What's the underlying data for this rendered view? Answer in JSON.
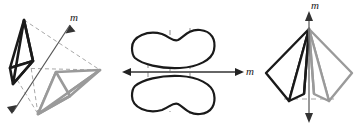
{
  "figure": {
    "caption_absent": true,
    "topic": "mirror-plane symmetry operations",
    "panels": [
      {
        "id": "panel-left",
        "name": "oblique-tetrahedra-pair",
        "axis_label": "m",
        "axis_orientation": "diagonal",
        "arrow_heads": "double",
        "object_count": 2,
        "object_dark_color": "#1a1a1a",
        "object_light_color": "#9a9a9a",
        "dashed_color": "#a8a8a8"
      },
      {
        "id": "panel-middle",
        "name": "reflected-blob-pair",
        "axis_label": "m",
        "axis_orientation": "horizontal",
        "arrow_heads": "double",
        "object_count": 2,
        "outline_color": "#1a1a1a",
        "dashed_color": "#a0a0a0"
      },
      {
        "id": "panel-right",
        "name": "mirrored-pyramid-pair",
        "axis_label": "m",
        "axis_orientation": "vertical",
        "arrow_heads": "double",
        "object_count": 2,
        "object_dark_color": "#1a1a1a",
        "object_light_color": "#9a9a9a",
        "dashed_color": "#a8a8a8"
      }
    ],
    "labels": {
      "left_m": "m",
      "middle_m": "m",
      "right_m": "m"
    }
  }
}
